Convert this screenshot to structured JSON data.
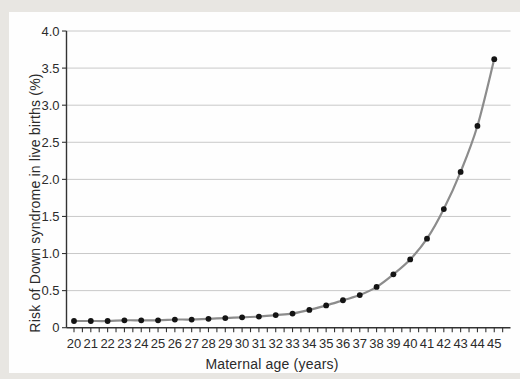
{
  "page": {
    "background": "#e8e6e2",
    "panel_background": "#fefefe"
  },
  "chart_data": {
    "type": "line",
    "xlabel": "Maternal age (years)",
    "ylabel": "Risk of Down syndrome in live births (%)",
    "x": [
      20,
      21,
      22,
      23,
      24,
      25,
      26,
      27,
      28,
      29,
      30,
      31,
      32,
      33,
      34,
      35,
      36,
      37,
      38,
      39,
      40,
      41,
      42,
      43,
      44,
      45
    ],
    "y": [
      0.09,
      0.09,
      0.09,
      0.1,
      0.1,
      0.1,
      0.11,
      0.11,
      0.12,
      0.13,
      0.14,
      0.15,
      0.17,
      0.19,
      0.24,
      0.3,
      0.37,
      0.44,
      0.55,
      0.72,
      0.92,
      1.2,
      1.6,
      2.1,
      2.72,
      3.62
    ],
    "series_name": "Risk of Down syndrome in live births",
    "xlim": [
      19.6,
      46
    ],
    "ylim": [
      0,
      4.0
    ],
    "x_tick_labels": [
      "20",
      "21",
      "22",
      "23",
      "24",
      "25",
      "26",
      "27",
      "28",
      "29",
      "30",
      "31",
      "32",
      "33",
      "34",
      "35",
      "36",
      "37",
      "38",
      "39",
      "40",
      "41",
      "42",
      "43",
      "44",
      "45"
    ],
    "y_tick_values": [
      0,
      0.5,
      1.0,
      1.5,
      2.0,
      2.5,
      3.0,
      3.5,
      4.0
    ],
    "y_tick_labels": [
      "0",
      "0.5",
      "1.0",
      "1.5",
      "2.0",
      "2.5",
      "3.0",
      "3.5",
      "4.0"
    ],
    "grid": "horizontal gridlines every 0.5",
    "legend": "none",
    "colors": {
      "line": "#8c8c8c",
      "marker": "#141414",
      "gridline": "#c9c9c9",
      "axis": "#333333",
      "text": "#2b2b2b"
    }
  }
}
